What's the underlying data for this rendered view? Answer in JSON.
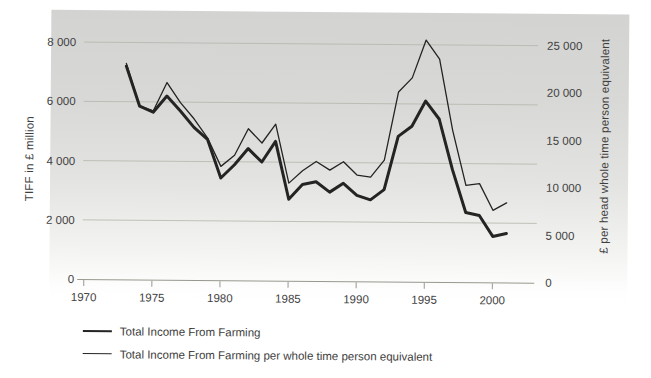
{
  "chart_data": {
    "type": "line",
    "x_years": [
      1973,
      1974,
      1975,
      1976,
      1977,
      1978,
      1979,
      1980,
      1981,
      1982,
      1983,
      1984,
      1985,
      1986,
      1987,
      1988,
      1989,
      1990,
      1991,
      1992,
      1993,
      1994,
      1995,
      1996,
      1997,
      1998,
      1999,
      2000,
      2001
    ],
    "series": [
      {
        "name": "Total Income From Farming",
        "axis": "left",
        "style": "thick",
        "values": [
          7200,
          5850,
          5650,
          6200,
          5700,
          5150,
          4750,
          3450,
          3900,
          4450,
          4000,
          4700,
          2750,
          3250,
          3350,
          3000,
          3300,
          2900,
          2750,
          3100,
          4900,
          5250,
          6100,
          5500,
          3800,
          2350,
          2250,
          1550,
          1650
        ]
      },
      {
        "name": "Total Income From Farming per whole time person equivalent",
        "axis": "right",
        "style": "thin",
        "values": [
          22800,
          18300,
          17800,
          20800,
          18700,
          17000,
          15000,
          12000,
          13200,
          16000,
          14500,
          16500,
          10300,
          11600,
          12600,
          11700,
          12600,
          11200,
          11000,
          12800,
          20000,
          21500,
          25500,
          23500,
          16000,
          10200,
          10400,
          7600,
          8400
        ]
      }
    ],
    "left_axis": {
      "title": "TIFF in £ million",
      "tick_labels": [
        "0",
        "2 000",
        "4 000",
        "6 000",
        "8 000"
      ],
      "tick_values": [
        0,
        2000,
        4000,
        6000,
        8000
      ],
      "max": 8000
    },
    "right_axis": {
      "title": "£ per head whole time person equivalent",
      "tick_labels": [
        "0",
        "5 000",
        "10 000",
        "15 000",
        "20 000",
        "25 000"
      ],
      "tick_values": [
        0,
        5000,
        10000,
        15000,
        20000,
        25000
      ],
      "max": 25000
    },
    "x_axis": {
      "tick_labels": [
        "1970",
        "1975",
        "1980",
        "1985",
        "1990",
        "1995",
        "2000"
      ],
      "tick_values": [
        1970,
        1975,
        1980,
        1985,
        1990,
        1995,
        2000
      ],
      "range": [
        1970,
        2002
      ]
    },
    "grid": "horizontal gridlines at left-axis ticks only",
    "legend_position": "bottom-left",
    "colors": {
      "line": "#242424",
      "grid": "#b5b5ad",
      "axis": "#98988f",
      "text": "#3f3f3f",
      "panel_top": "#d3d3d2",
      "panel_bottom": "#ffffff"
    }
  }
}
